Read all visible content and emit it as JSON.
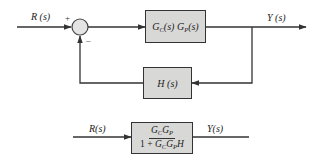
{
  "diagram": {
    "closed_loop": {
      "input_label": "R (s)",
      "output_label": "Y (s)",
      "summing_junction": {
        "plus_sign": "+",
        "minus_sign": "–"
      },
      "forward_block": {
        "G": "G",
        "C": "C",
        "P": "P",
        "s": "(s)",
        "text": "G_C(s) G_P(s)"
      },
      "feedback_block": {
        "text": "H (s)"
      }
    },
    "equivalent": {
      "input_label": "R(s)",
      "output_label": "Y(s)",
      "block": {
        "numerator": "G_C G_P",
        "denominator": "1 + G_C G_P H",
        "den_prefix": "1 + "
      }
    },
    "colors": {
      "line": "#333333",
      "block_fill": "#d8d8d6",
      "junction_fill": "#e4e4e4"
    }
  }
}
